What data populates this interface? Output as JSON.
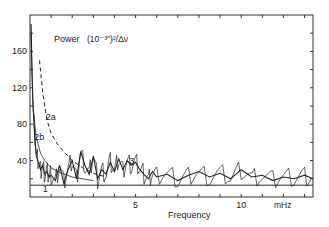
{
  "chart_data": {
    "type": "line",
    "title": "Power (10⁻³″)²/Δν",
    "title_parts": {
      "word": "Power",
      "unit": "(10⁻³″)²/Δν"
    },
    "xlabel": "Frequency",
    "xunit": "mHz",
    "ylabel": "Power",
    "xlim": [
      0,
      13.4
    ],
    "ylim": [
      0,
      200
    ],
    "x_ticks": [
      1,
      2,
      3,
      4,
      5,
      6,
      7,
      8,
      9,
      10,
      11,
      12,
      13
    ],
    "x_tick_labels": [
      {
        "v": 5,
        "label": "5"
      },
      {
        "v": 10,
        "label": "10"
      }
    ],
    "y_ticks": [
      20,
      40,
      60,
      80,
      100,
      120,
      140,
      160,
      180
    ],
    "y_tick_labels": [
      {
        "v": 40,
        "label": "40"
      },
      {
        "v": 80,
        "label": "80"
      },
      {
        "v": 120,
        "label": "120"
      },
      {
        "v": 160,
        "label": "160"
      }
    ],
    "grid": false,
    "annotations": [
      {
        "label": "1",
        "x": 0.6,
        "y": 6
      },
      {
        "label": "2a",
        "x": 0.75,
        "y": 85
      },
      {
        "label": "2b",
        "x": 0.2,
        "y": 63
      },
      {
        "label": "3",
        "x": 4.7,
        "y": 36
      }
    ],
    "series": [
      {
        "name": "1",
        "style": "solid-horizontal",
        "values": [
          {
            "x": 0,
            "y": 13
          },
          {
            "x": 13.4,
            "y": 13
          }
        ]
      },
      {
        "name": "2a",
        "style": "dashed",
        "x": [
          0.45,
          0.6,
          0.8,
          1.0,
          1.3,
          1.6,
          2.0,
          2.5,
          3.0,
          3.6
        ],
        "values": [
          150,
          115,
          85,
          70,
          58,
          50,
          40,
          32,
          26,
          22
        ]
      },
      {
        "name": "2b",
        "style": "thin-solid",
        "x": [
          0.15,
          0.3,
          0.5,
          0.7,
          1.0,
          1.5,
          2.0,
          2.5,
          3.0
        ],
        "values": [
          95,
          65,
          48,
          40,
          32,
          26,
          22,
          20,
          18
        ]
      },
      {
        "name": "spectrum",
        "style": "noisy-solid",
        "x": [
          0.05,
          0.1,
          0.15,
          0.2,
          0.3,
          0.4,
          0.5,
          0.6,
          0.7,
          0.8,
          0.9,
          1.0,
          1.2,
          1.4,
          1.6,
          1.8,
          2.0,
          2.2,
          2.4,
          2.6,
          2.8,
          3.0,
          3.2,
          3.4,
          3.6,
          3.8,
          4.0,
          4.2,
          4.4,
          4.6,
          4.8,
          5.0,
          5.2,
          5.4,
          5.6,
          5.8,
          6.0,
          6.5,
          7.0,
          7.5,
          8.0,
          8.5,
          9.0,
          9.5,
          10.0,
          10.5,
          11.0,
          11.5,
          12.0,
          12.5,
          13.0,
          13.4
        ],
        "values": [
          190,
          130,
          100,
          75,
          45,
          38,
          30,
          35,
          25,
          28,
          22,
          24,
          18,
          35,
          15,
          30,
          40,
          20,
          50,
          35,
          25,
          45,
          20,
          30,
          25,
          38,
          28,
          42,
          30,
          40,
          35,
          38,
          30,
          25,
          20,
          28,
          22,
          25,
          18,
          24,
          28,
          22,
          26,
          20,
          30,
          22,
          24,
          18,
          22,
          20,
          24,
          20
        ]
      }
    ]
  }
}
